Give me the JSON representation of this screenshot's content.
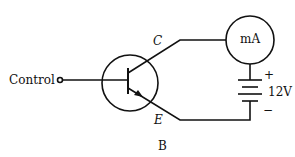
{
  "diagram": {
    "type": "transistor-circuit",
    "caption": "B",
    "labels": {
      "control": "Control",
      "collector": "C",
      "emitter": "E",
      "meter": "mA",
      "battery_voltage": "12V",
      "battery_plus": "+",
      "battery_minus": "−"
    },
    "components": [
      "control-terminal",
      "npn-transistor",
      "milliammeter",
      "battery"
    ],
    "colors": {
      "line": "#111111",
      "background": "#ffffff"
    }
  }
}
